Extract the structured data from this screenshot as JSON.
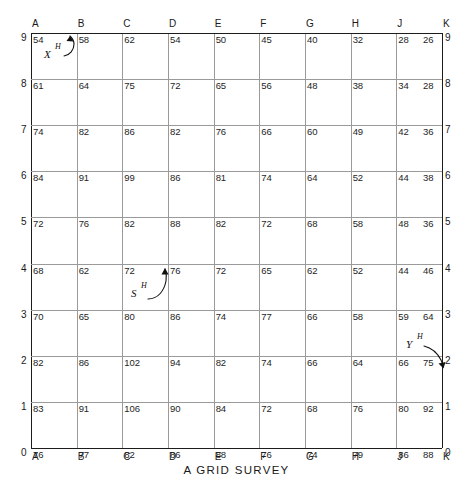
{
  "figure": {
    "caption": "A  GRID  SURVEY",
    "title": "A GRID SURVEY"
  },
  "chart_data": {
    "type": "heatmap",
    "title": "A GRID SURVEY",
    "xlabel": "",
    "ylabel": "",
    "grid": true,
    "legend": "none",
    "columns": [
      "A",
      "B",
      "C",
      "D",
      "E",
      "F",
      "G",
      "H",
      "J",
      "K"
    ],
    "rows": [
      "9",
      "8",
      "7",
      "6",
      "5",
      "4",
      "3",
      "2",
      "1",
      "0"
    ],
    "xlim": [
      0,
      10
    ],
    "ylim": [
      0,
      9
    ],
    "note": "Spot-height values posted at each grid intersection; columns A-K (letter I omitted), rows 0-9.",
    "values": [
      [
        54,
        58,
        62,
        54,
        50,
        45,
        40,
        32,
        28,
        26
      ],
      [
        61,
        64,
        75,
        72,
        65,
        56,
        48,
        38,
        34,
        28
      ],
      [
        74,
        82,
        86,
        82,
        76,
        66,
        60,
        49,
        42,
        36
      ],
      [
        84,
        91,
        99,
        86,
        81,
        74,
        64,
        52,
        44,
        38
      ],
      [
        72,
        76,
        82,
        88,
        82,
        72,
        68,
        58,
        48,
        36
      ],
      [
        68,
        62,
        72,
        76,
        72,
        65,
        62,
        52,
        44,
        46
      ],
      [
        70,
        65,
        80,
        86,
        74,
        77,
        66,
        58,
        59,
        64
      ],
      [
        82,
        86,
        102,
        94,
        82,
        74,
        66,
        64,
        66,
        75
      ],
      [
        83,
        91,
        106,
        90,
        84,
        72,
        68,
        76,
        80,
        92
      ],
      [
        76,
        77,
        82,
        86,
        88,
        76,
        74,
        79,
        86,
        88
      ]
    ]
  },
  "axes": {
    "columns_top": [
      "A",
      "B",
      "C",
      "D",
      "E",
      "F",
      "G",
      "H",
      "J",
      "K"
    ],
    "columns_bottom": [
      "A",
      "B",
      "C",
      "D",
      "E",
      "F",
      "G",
      "H",
      "J",
      "K"
    ],
    "rows_left": [
      "9",
      "8",
      "7",
      "6",
      "5",
      "4",
      "3",
      "2",
      "1",
      "0"
    ],
    "rows_right": [
      "9",
      "8",
      "7",
      "6",
      "5",
      "4",
      "3",
      "2",
      "1",
      "0"
    ]
  },
  "annotations": [
    {
      "id": "x-h",
      "letter": "X",
      "superscript": "H",
      "target_cell": "B9"
    },
    {
      "id": "s-h",
      "letter": "S",
      "superscript": "H",
      "target_cell": "D4"
    },
    {
      "id": "y-h",
      "letter": "Y",
      "superscript": "H",
      "target_cell": "K2"
    }
  ],
  "colors": {
    "background": "#ffffff",
    "grid_line": "#9a9a9a",
    "border_line": "#1c1c1c",
    "text": "#1a1a1a"
  }
}
